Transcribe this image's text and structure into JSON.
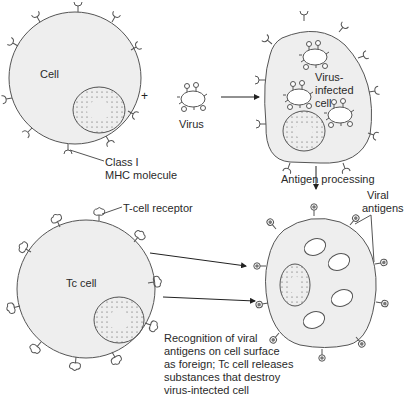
{
  "labels": {
    "cell": "Cell",
    "plus": "+",
    "virus": "Virus",
    "class1_line1": "Class I",
    "class1_line2": "MHC molecule",
    "infected_line1": "Virus-",
    "infected_line2": "infected",
    "infected_line3": "cell",
    "antigen_processing": "Antigen processing",
    "viral_line1": "Viral",
    "viral_line2": "antigens",
    "tcr": "T-cell receptor",
    "tc_cell": "Tc cell",
    "recog_line1": "Recognition of viral",
    "recog_line2": "antigens on cell surface",
    "recog_line3": "as foreign; Tc cell releases",
    "recog_line4": "substances that destroy",
    "recog_line5": "virus-intected cell"
  },
  "colors": {
    "cell_fill": "#eeeeee",
    "outline": "#555555",
    "antigen_dot": "#777777"
  }
}
